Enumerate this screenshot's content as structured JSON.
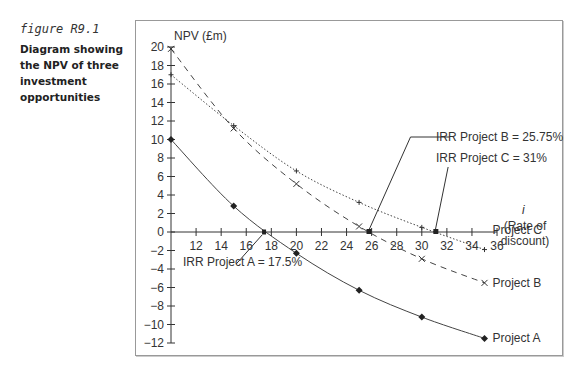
{
  "caption": {
    "figure_label": "figure R9.1",
    "title": "Diagram showing the NPV of three investment opportunities"
  },
  "chart_data": {
    "type": "line",
    "title": "Diagram showing the NPV of three investment opportunities",
    "xlabel": "i (Rate of discount)",
    "ylabel": "NPV (£m)",
    "x_ticks": [
      12,
      14,
      16,
      18,
      20,
      22,
      24,
      26,
      28,
      30,
      32,
      34,
      36
    ],
    "y_ticks": [
      20,
      18,
      16,
      14,
      12,
      10,
      8,
      6,
      4,
      2,
      0,
      -2,
      -4,
      -6,
      -8,
      -10,
      -12
    ],
    "xlim": [
      10,
      36
    ],
    "ylim": [
      -12,
      20
    ],
    "grid": false,
    "legend_position": "inline at line ends",
    "x": [
      10,
      15,
      20,
      25,
      30,
      35
    ],
    "series": [
      {
        "name": "Project A",
        "style": "solid",
        "marker": "diamond",
        "values": [
          10,
          2.8,
          -2.3,
          -6.3,
          -9.2,
          -11.5
        ]
      },
      {
        "name": "Project B",
        "style": "dashed",
        "marker": "x",
        "values": [
          19.8,
          11.2,
          5.2,
          0.6,
          -2.9,
          -5.5
        ]
      },
      {
        "name": "Project C",
        "style": "dotted",
        "marker": "plus",
        "values": [
          17,
          11.5,
          6.6,
          3.2,
          0.5,
          -1.9
        ]
      }
    ],
    "annotations": [
      {
        "text": "IRR Project A = 17.5%",
        "x": 17.5,
        "y": 0
      },
      {
        "text": "IRR Project B = 25.75%",
        "x": 25.75,
        "y": 0
      },
      {
        "text": "IRR Project C = 31%",
        "x": 31,
        "y": 0
      }
    ]
  },
  "axis": {
    "y_title": "NPV (£m)",
    "x_title_symbol": "i",
    "x_title_line1": "(Rate of",
    "x_title_line2": "discount)"
  }
}
